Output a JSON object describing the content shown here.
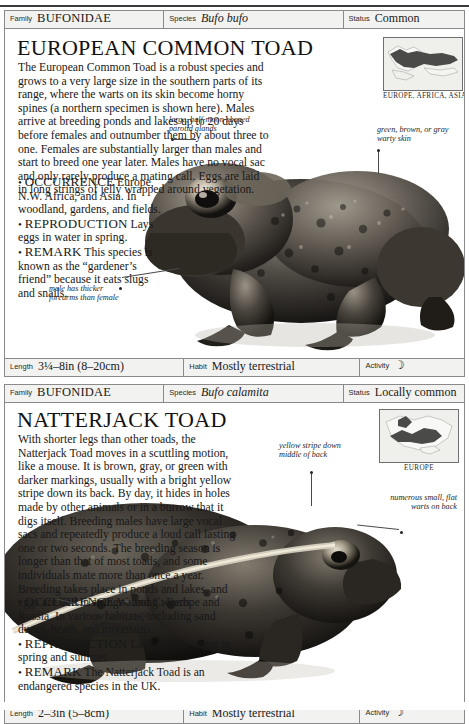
{
  "page": {
    "field_labels": {
      "family": "Family",
      "species": "Species",
      "status": "Status",
      "length": "Length",
      "habit": "Habit",
      "activity": "Activity"
    }
  },
  "entries": [
    {
      "family": "BUFONIDAE",
      "species": "Bufo bufo",
      "status": "Common",
      "title": "EUROPEAN COMMON TOAD",
      "prose": "The European Common Toad is a robust species and grows to a very large size in the southern parts of its range, where the warts on its skin become horny spines (a northern specimen is shown here). Males arrive at breeding ponds and lakes up to 20 days before females and outnumber them by about three to one. Females are substantially larger than males and start to breed one year later. Males have no vocal sac and only rarely produce a mating call. Eggs are laid in long strings of jelly wrapped around vegetation.",
      "bullets": [
        {
          "label": "OCCURRENCE",
          "text": "Europe, N.W. Africa, and Asia. In woodland, gardens, and fields."
        },
        {
          "label": "REPRODUCTION",
          "text": "Lays eggs in water in spring."
        },
        {
          "label": "REMARK",
          "text": "This species is known as the “gardener’s friend” because it eats slugs and snails."
        }
      ],
      "map_caption": "EUROPE, AFRICA, ASIA",
      "annotations": [
        {
          "name": "parotid-glands",
          "text": "large, half-moon-shaped parotid glands"
        },
        {
          "name": "warty-skin",
          "text": "green, brown, or gray warty skin"
        },
        {
          "name": "male-forearms",
          "text": "male has thicker forearms than female"
        }
      ],
      "length": "3¼–8in (8–20cm)",
      "habit": "Mostly terrestrial",
      "activity_icon": "moon-icon",
      "activity_glyph": "☽"
    },
    {
      "family": "BUFONIDAE",
      "species": "Bufo calamita",
      "status": "Locally common",
      "title": "NATTERJACK TOAD",
      "prose": "With shorter legs than other toads, the Natterjack Toad moves in a scuttling motion, like a mouse. It is brown, gray, or green with darker markings, usually with a bright yellow stripe down its back. By day, it hides in holes made by other animals or in a burrow that it digs itself. Breeding males have large vocal sacs and repeatedly produce a loud call lasting one or two seconds. The breeding season is longer than that of most toads, and some individuals mate more than once a year. Breeding takes place in ponds and lakes, and eggs are laid in strings among weeds.",
      "bullets": [
        {
          "label": "OCCURRENCE",
          "text": "W. and C. Europe and Russia. In various habitats, including sand dunes, heath, and mountains."
        },
        {
          "label": "REPRODUCTION",
          "text": "Lays eggs in water in spring and summer."
        },
        {
          "label": "REMARK",
          "text": "The Natterjack Toad is an endangered species in the UK."
        }
      ],
      "map_caption": "EUROPE",
      "annotations": [
        {
          "name": "yellow-stripe",
          "text": "yellow stripe down middle of back"
        },
        {
          "name": "flat-warts",
          "text": "numerous small, flat warts on back"
        },
        {
          "name": "short-limbs",
          "text": "short limbs enable Natterjack to run rather than hop"
        }
      ],
      "length": "2–3in (5–8cm)",
      "habit": "Mostly terrestrial",
      "activity_icon": "moon-icon",
      "activity_glyph": "☽"
    }
  ]
}
